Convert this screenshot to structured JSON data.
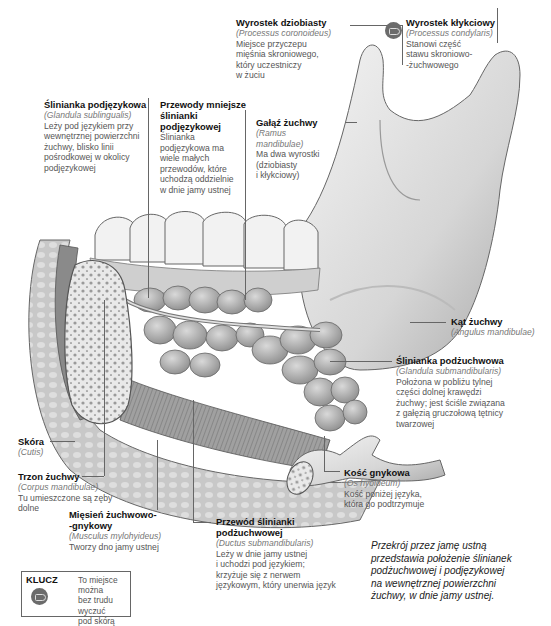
{
  "labels": {
    "processus_coronoideus": {
      "title": "Wyrostek dziobiasty",
      "latin": "(Processus coronoideus)",
      "desc": [
        "Miejsce przyczepu",
        "mięśnia skroniowego,",
        "który uczestniczy",
        "w żuciu"
      ]
    },
    "processus_condylaris": {
      "title": "Wyrostek kłykciowy",
      "latin": "(Processus condylaris)",
      "desc": [
        "Stanowi część",
        "stawu skroniowo-",
        "-żuchwowego"
      ],
      "palpable": true
    },
    "glandula_sublingualis": {
      "title": "Ślinianka podjęzykowa",
      "latin": "(Glandula sublingualis)",
      "desc": [
        "Leży pod językiem przy",
        "wewnętrznej powierzchni",
        "żuchwy, blisko linii",
        "pośrodkowej w okolicy",
        "podjęzykowej"
      ]
    },
    "ductus_sublinguales": {
      "title": [
        "Przewody mniejsze",
        "ślinianki",
        "podjęzykowej"
      ],
      "desc": [
        "Ślinianka",
        "podjęzykowa ma",
        "wiele małych",
        "przewodów, które",
        "uchodzą oddzielnie",
        "w dnie jamy ustnej"
      ]
    },
    "ramus_mandibulae": {
      "title": "Gałąź żuchwy",
      "latin": [
        "(Ramus",
        "mandibulae)"
      ],
      "desc": [
        "Ma dwa wyrostki",
        "(dziobiasty",
        "i kłykciowy)"
      ]
    },
    "angulus_mandibulae": {
      "title": "Kąt żuchwy",
      "latin": "(Angulus mandibulae)"
    },
    "glandula_submandibularis": {
      "title": "Ślinianka podżuchwowa",
      "latin": "(Glandula submandibularis)",
      "desc": [
        "Położona w pobliżu tylnej",
        "części dolnej krawędzi",
        "żuchwy; jest ściśle związana",
        "z gałęzią gruczołową tętnicy",
        "twarzowej"
      ]
    },
    "cutis": {
      "title": "Skóra",
      "latin": "(Cutis)"
    },
    "corpus_mandibulae": {
      "title": "Trzon żuchwy",
      "latin": "(Corpus mandibulae)",
      "desc": [
        "Tu umieszczone są zęby",
        "dolne"
      ]
    },
    "musculus_mylohyoideus": {
      "title": [
        "Mięsień żuchwowo-",
        "-gnykowy"
      ],
      "latin": "(Musculus mylohyideus)",
      "desc": [
        "Tworzy dno jamy ustnej"
      ]
    },
    "os_hyoideum": {
      "title": "Kość gnykowa",
      "latin": "(Os hyoideum)",
      "desc": [
        "Kość poniżej języka,",
        "która go podtrzymuje"
      ]
    },
    "ductus_submandibularis": {
      "title": [
        "Przewód ślinianki",
        "podżuchwowej"
      ],
      "latin": "(Ductus submandibularis)",
      "desc": [
        "Leży w dnie jamy ustnej",
        "i uchodzi pod językiem;",
        "krzyżuje się z nerwem",
        "językowym, który unerwia język"
      ]
    }
  },
  "key": {
    "title": "KLUCZ",
    "icon": "palpation-hand-icon",
    "desc": [
      "To miejsce można",
      "bez trudu wyczuć",
      "pod skórą"
    ]
  },
  "caption": [
    "Przekrój przez jamę ustną",
    "przedstawia położenie ślinianek",
    "podżuchwowej i podjęzykowej",
    "na wewnętrznej powierzchni",
    "żuchwy, w dnie jamy ustnej."
  ],
  "colors": {
    "background": "#ffffff",
    "bone": "#e2e2e2",
    "gland": "#b9b9b9",
    "muscle": "#8f8f8f",
    "leader_line": "#666666",
    "title_text": "#111111",
    "latin_text": "#777777",
    "body_text": "#555555"
  }
}
